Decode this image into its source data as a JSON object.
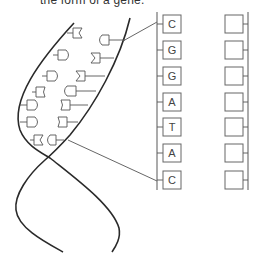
{
  "caption": "the form of a gene.",
  "figure": {
    "type": "dna-double-helix-with-base-sequence",
    "left_column": {
      "label": "sequence",
      "bases": [
        "C",
        "G",
        "G",
        "A",
        "T",
        "A",
        "C"
      ]
    },
    "right_column": {
      "label": "complementary-sequence-blank",
      "bases": [
        "",
        "",
        "",
        "",
        "",
        "",
        ""
      ]
    },
    "colors": {
      "stroke": "#2a2a2a",
      "box_stroke": "#666666",
      "text": "#444444",
      "background": "#ffffff"
    }
  }
}
